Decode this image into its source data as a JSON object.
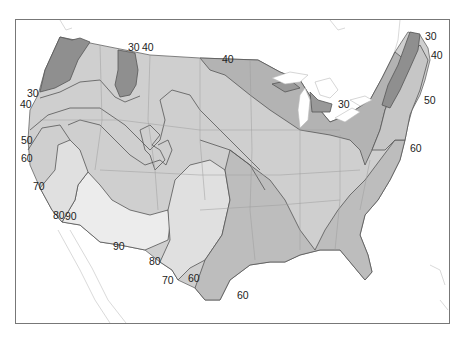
{
  "map": {
    "type": "isoline map",
    "region": "Contiguous United States",
    "colors": {
      "frame": "#777777",
      "background": "#ffffff",
      "darkest_zone": "#8f8f8f",
      "dark_zone": "#a9a9a9",
      "mid_zone": "#bdbdbd",
      "light_zone": "#d0d0d0",
      "lighter_zone": "#dedede",
      "lightest_zone": "#ebebeb",
      "contour_line": "#555555",
      "state_border": "#9a9a9a",
      "outline_neighbors": "#c8c8c8"
    },
    "contour_labels": [
      {
        "id": "nw-30-top",
        "text": "30",
        "x": 128,
        "y": 51
      },
      {
        "id": "nw-40-top",
        "text": "40",
        "x": 142,
        "y": 51
      },
      {
        "id": "north-40",
        "text": "40",
        "x": 222,
        "y": 63
      },
      {
        "id": "ne-30",
        "text": "30",
        "x": 425,
        "y": 40
      },
      {
        "id": "ne-40",
        "text": "40",
        "x": 431,
        "y": 59
      },
      {
        "id": "ne-50",
        "text": "50",
        "x": 424,
        "y": 104
      },
      {
        "id": "mi-30",
        "text": "30",
        "x": 338,
        "y": 108
      },
      {
        "id": "ne-60",
        "text": "60",
        "x": 410,
        "y": 152
      },
      {
        "id": "w-30",
        "text": "30",
        "x": 27,
        "y": 97
      },
      {
        "id": "w-40",
        "text": "40",
        "x": 20,
        "y": 108
      },
      {
        "id": "w-50",
        "text": "50",
        "x": 21,
        "y": 144
      },
      {
        "id": "w-60",
        "text": "60",
        "x": 21,
        "y": 162
      },
      {
        "id": "w-70",
        "text": "70",
        "x": 33,
        "y": 190
      },
      {
        "id": "sw-80",
        "text": "80",
        "x": 53,
        "y": 219
      },
      {
        "id": "sw-90a",
        "text": "90",
        "x": 65,
        "y": 220
      },
      {
        "id": "sw-90b",
        "text": "90",
        "x": 113,
        "y": 250
      },
      {
        "id": "s-80",
        "text": "80",
        "x": 149,
        "y": 265
      },
      {
        "id": "s-70",
        "text": "70",
        "x": 162,
        "y": 284
      },
      {
        "id": "s-60a",
        "text": "60",
        "x": 188,
        "y": 282
      },
      {
        "id": "s-60b",
        "text": "60",
        "x": 237,
        "y": 299
      }
    ]
  }
}
